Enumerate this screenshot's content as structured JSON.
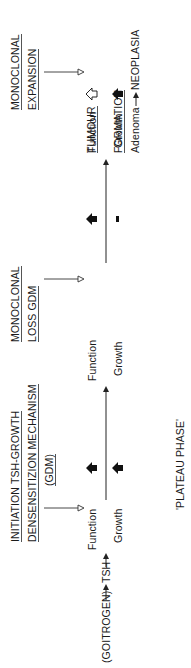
{
  "diagram": {
    "stage1": {
      "title_line1": "INITIATION TSH-GROWTH",
      "title_line2": "DENSENSITIZION MECHANISM",
      "title_line3": "(GDM)",
      "function_label": "Function",
      "growth_label": "Growth"
    },
    "stage2": {
      "title_line1": "MONOCLONAL",
      "title_line2": "LOSS GDM",
      "function_label": "Function",
      "growth_label": "Growth"
    },
    "stage3": {
      "title_line1": "MONOCLONAL",
      "title_line2": "EXPANSION",
      "function_label": "Function",
      "growth_label": "Growth"
    },
    "stage4": {
      "title_line1": "TUMOUR",
      "title_line2": "FORMATION",
      "adenoma_label": "Adenoma",
      "neoplasia_label": "NEOPLASIA"
    },
    "input": {
      "goitrogen_label": "(GOITROGEN)",
      "tsh_label": "TSH"
    },
    "footer": {
      "plateau_label": "'PLATEAU PHASE'"
    },
    "orientation": "rotated-90-ccw"
  }
}
